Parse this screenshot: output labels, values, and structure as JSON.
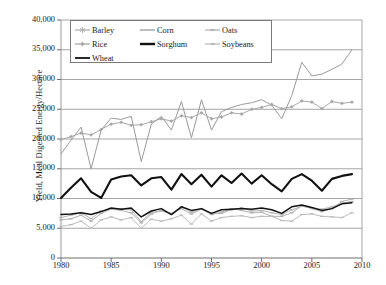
{
  "chart_data": {
    "type": "line",
    "title": "",
    "xlabel": "",
    "ylabel": "Yield, Mcal Digested Energy/Hectare",
    "xlim": [
      1980,
      2010
    ],
    "ylim": [
      0,
      40000
    ],
    "xticks": [
      1980,
      1985,
      1990,
      1995,
      2000,
      2005,
      2010
    ],
    "yticks": [
      0,
      5000,
      10000,
      15000,
      20000,
      25000,
      30000,
      35000,
      40000
    ],
    "ytick_labels": [
      "0",
      "5,000",
      "10,000",
      "15,000",
      "20,000",
      "25,000",
      "30,000",
      "35,000",
      "40,000"
    ],
    "xtick_labels": [
      "1980",
      "1985",
      "1990",
      "1995",
      "2000",
      "2005",
      "2010"
    ],
    "grid": "horizontal",
    "legend_position": "top-left-inside",
    "x": [
      1980,
      1981,
      1982,
      1983,
      1984,
      1985,
      1986,
      1987,
      1988,
      1989,
      1990,
      1991,
      1992,
      1993,
      1994,
      1995,
      1996,
      1997,
      1998,
      1999,
      2000,
      2001,
      2002,
      2003,
      2004,
      2005,
      2006,
      2007,
      2008,
      2009
    ],
    "series": [
      {
        "name": "Barley",
        "color": "#b0b0b0",
        "marker": "star",
        "width": 1,
        "values": [
          6400,
          6600,
          7200,
          6200,
          7500,
          8200,
          8000,
          7600,
          5900,
          7400,
          8000,
          7500,
          8300,
          7400,
          8200,
          7300,
          7700,
          8300,
          8000,
          7600,
          7700,
          7000,
          7000,
          7600,
          8800,
          8300,
          7800,
          8300,
          9500,
          9900
        ]
      },
      {
        "name": "Corn",
        "color": "#9a9a9a",
        "marker": "none",
        "width": 1,
        "values": [
          17500,
          19800,
          22000,
          15000,
          21500,
          23500,
          23300,
          23800,
          16200,
          22500,
          23800,
          21500,
          26300,
          20200,
          26600,
          21500,
          24600,
          25300,
          25800,
          26100,
          26600,
          25700,
          23400,
          27300,
          32900,
          30600,
          30900,
          31700,
          32600,
          35000
        ]
      },
      {
        "name": "Oats",
        "color": "#b5b5b5",
        "marker": "dash",
        "width": 1,
        "values": [
          6800,
          7200,
          7600,
          6600,
          7900,
          8200,
          8300,
          8100,
          6100,
          7700,
          7900,
          7400,
          8600,
          7700,
          8300,
          7500,
          7500,
          8100,
          8400,
          7900,
          8000,
          7600,
          7300,
          8100,
          8700,
          8400,
          8200,
          8600,
          9200,
          9500
        ]
      },
      {
        "name": "Rice",
        "color": "#a8a8a8",
        "marker": "diamond",
        "width": 1,
        "values": [
          19900,
          20400,
          21000,
          20700,
          21600,
          22500,
          22800,
          22300,
          22400,
          22900,
          23400,
          23000,
          23900,
          23600,
          24400,
          23400,
          23700,
          24400,
          24200,
          25000,
          25300,
          25800,
          25100,
          25400,
          26400,
          26200,
          25100,
          26300,
          26000,
          26200
        ]
      },
      {
        "name": "Sorghum",
        "color": "#111111",
        "marker": "none",
        "width": 2.1,
        "values": [
          10100,
          11800,
          13400,
          11100,
          10100,
          13200,
          13700,
          13900,
          12200,
          13400,
          13600,
          11500,
          14100,
          12400,
          14000,
          12000,
          13900,
          12600,
          14200,
          12500,
          13900,
          12400,
          11200,
          13300,
          14100,
          13000,
          11300,
          13300,
          13800,
          14100
        ]
      },
      {
        "name": "Soybeans",
        "color": "#bcbcbc",
        "marker": "dash",
        "width": 1,
        "values": [
          5300,
          5600,
          6200,
          5000,
          6400,
          6900,
          6400,
          6800,
          5000,
          6500,
          6200,
          6600,
          7200,
          5700,
          7400,
          6200,
          6800,
          7000,
          7100,
          6800,
          7000,
          7000,
          6300,
          6200,
          7300,
          7400,
          7000,
          6900,
          6800,
          7600
        ]
      },
      {
        "name": "Wheat",
        "color": "#111111",
        "marker": "none",
        "width": 1.5,
        "values": [
          7300,
          7400,
          7600,
          7300,
          7800,
          8400,
          8200,
          8400,
          6900,
          7900,
          8300,
          7300,
          8600,
          8000,
          8300,
          7500,
          8100,
          8200,
          8300,
          8200,
          8400,
          8100,
          7500,
          8600,
          8900,
          8500,
          8000,
          8300,
          9100,
          9300
        ]
      }
    ]
  },
  "axis": {
    "ylabel": "Yield, Mcal Digested Energy/Hectare"
  },
  "legend": {
    "items": [
      {
        "label": "Barley"
      },
      {
        "label": "Corn"
      },
      {
        "label": "Oats"
      },
      {
        "label": "Rice"
      },
      {
        "label": "Sorghum"
      },
      {
        "label": "Soybeans"
      },
      {
        "label": "Wheat"
      }
    ]
  }
}
